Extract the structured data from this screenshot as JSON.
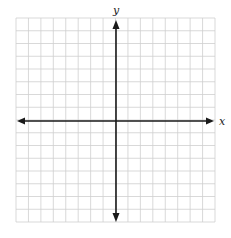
{
  "diagram": {
    "type": "coordinate-plane",
    "grid": {
      "columns": 16,
      "rows": 16,
      "left": 16,
      "top": 18,
      "right": 215,
      "bottom": 222,
      "line_color": "#cfcfcf"
    },
    "origin": {
      "x": 116,
      "y": 121
    },
    "axes": {
      "x_label": "x",
      "y_label": "y",
      "color": "#1a1a1a"
    }
  }
}
